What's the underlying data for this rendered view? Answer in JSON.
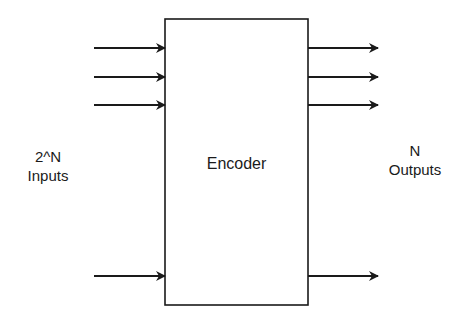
{
  "diagram": {
    "block": {
      "label": "Encoder",
      "x": 165,
      "y": 19,
      "w": 143,
      "h": 286
    },
    "inputs": {
      "label_line1": "2^N",
      "label_line2": "Inputs",
      "arrow_ys": [
        48,
        77,
        105,
        276
      ],
      "x_start": 94,
      "x_end": 165
    },
    "outputs": {
      "label_line1": "N",
      "label_line2": "Outputs",
      "arrow_ys": [
        48,
        77,
        105,
        276
      ],
      "x_start": 308,
      "x_end": 378
    },
    "stroke_color": "#1a1a1a"
  }
}
